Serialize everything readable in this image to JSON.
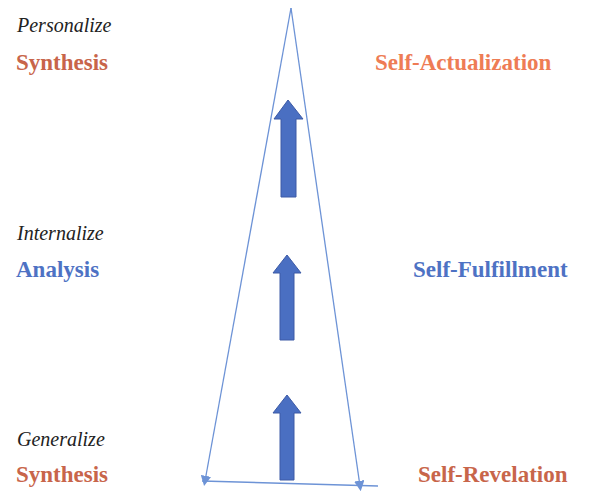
{
  "colors": {
    "orange_red": "#c8654a",
    "orange": "#ee7c55",
    "blue": "#4e72c4",
    "line_blue": "#6d93d6",
    "arrow_fill": "#4a6fc2",
    "arrow_stroke": "#3c5aa6"
  },
  "left": {
    "top": {
      "verb": "Personalize",
      "term": "Synthesis"
    },
    "middle": {
      "verb": "Internalize",
      "term": "Analysis"
    },
    "bottom": {
      "verb": "Generalize",
      "term": "Synthesis"
    }
  },
  "right": {
    "top": "Self-Actualization",
    "middle": "Self-Fulfillment",
    "bottom": "Self-Revelation"
  },
  "arrows": [
    {
      "name": "arrow-bottom",
      "icon": "up-arrow-icon"
    },
    {
      "name": "arrow-middle",
      "icon": "up-arrow-icon"
    },
    {
      "name": "arrow-top",
      "icon": "up-arrow-icon"
    }
  ]
}
